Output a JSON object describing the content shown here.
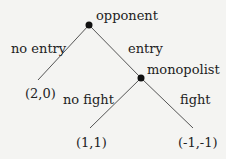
{
  "tree": {
    "root": {
      "player": "opponent"
    },
    "edges": {
      "no_entry": "no entry",
      "entry": "entry",
      "no_fight": "no fight",
      "fight": "fight"
    },
    "decision_node": {
      "player": "monopolist"
    },
    "payoffs": {
      "no_entry": "(2,0)",
      "no_fight": "(1,1)",
      "fight": "(-1,-1)"
    }
  }
}
